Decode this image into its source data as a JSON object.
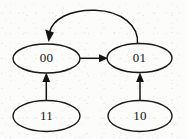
{
  "diagram": {
    "type": "state-transition-diagram",
    "canvas": {
      "width": 188,
      "height": 139
    },
    "style": {
      "background_color": "#fcfcfb",
      "stroke_color": "#141414",
      "text_color": "#121212",
      "node_fill": "none"
    },
    "nodes": [
      {
        "id": "s00",
        "label": "00",
        "cx": 46.5,
        "cy": 58.5,
        "rx": 33.5,
        "ry": 14.5
      },
      {
        "id": "s01",
        "label": "01",
        "cx": 139.5,
        "cy": 58.0,
        "rx": 32.5,
        "ry": 14.5
      },
      {
        "id": "s11",
        "label": "11",
        "cx": 46.5,
        "cy": 116.0,
        "rx": 33.5,
        "ry": 15.5
      },
      {
        "id": "s10",
        "label": "10",
        "cx": 140.0,
        "cy": 116.0,
        "rx": 32.0,
        "ry": 15.5
      }
    ],
    "edges": [
      {
        "id": "e-00-to-01",
        "from": "00",
        "to": "01",
        "shape": "straight",
        "direction": "right"
      },
      {
        "id": "e-01-to-00",
        "from": "01",
        "to": "00",
        "shape": "curved-arc",
        "direction": "left-over-top"
      },
      {
        "id": "e-11-to-00",
        "from": "11",
        "to": "00",
        "shape": "straight",
        "direction": "up"
      },
      {
        "id": "e-10-to-01",
        "from": "10",
        "to": "01",
        "shape": "straight",
        "direction": "up"
      }
    ]
  }
}
